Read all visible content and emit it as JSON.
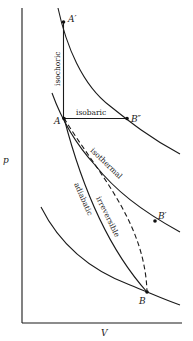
{
  "diagram": {
    "axes": {
      "y_label": "p",
      "x_label": "V"
    },
    "points": {
      "A_prime": "A′",
      "A": "A",
      "B_double_prime": "B″",
      "B_prime": "B′",
      "B": "B"
    },
    "process_labels": {
      "isochoric": "isochoric",
      "isobaric": "isobaric",
      "isothermal": "isothermal",
      "irreversible": "irreversible",
      "adiabatic": "adiabatic"
    },
    "colors": {
      "ink": "#1a1a1a",
      "background": "#ffffff"
    }
  }
}
